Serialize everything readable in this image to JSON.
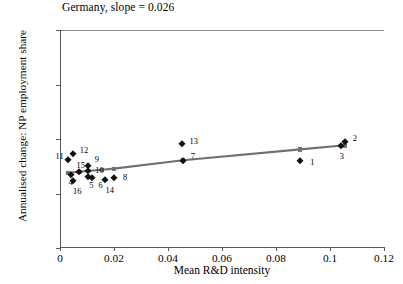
{
  "chart_data": {
    "type": "scatter",
    "title": "Germany, slope = 0.026",
    "xlabel": "Mean R&D intensity",
    "ylabel": "Annualised change: NP employment share",
    "xlim": [
      0,
      0.12
    ],
    "ylim": [
      -0.005,
      0.015
    ],
    "xticks": [
      "0",
      "0.02",
      "0.04",
      "0.06",
      "0.08",
      "0.1",
      "0.12"
    ],
    "xtick_values": [
      0,
      0.02,
      0.04,
      0.06,
      0.08,
      0.1,
      0.12
    ],
    "yticks": [
      "-0.005",
      "0",
      "0.005",
      "0.01",
      "0.015"
    ],
    "ytick_values": [
      -0.005,
      0,
      0.005,
      0.01,
      0.015
    ],
    "grid": false,
    "legend": "none",
    "slope": 0.026,
    "reference_line_y": 0,
    "marker_color": "#111111",
    "fit_color": "#6e7073",
    "points": [
      {
        "label": "1",
        "x": 0.089,
        "y": 0.00295,
        "lx": 10,
        "ly": 2
      },
      {
        "label": "2",
        "x": 0.1055,
        "y": 0.00475,
        "lx": 8,
        "ly": -3
      },
      {
        "label": "3",
        "x": 0.104,
        "y": 0.0044,
        "lx": -1,
        "ly": 11
      },
      {
        "label": "4",
        "x": 0.004,
        "y": 0.0017,
        "lx": -2,
        "ly": 8
      },
      {
        "label": "5",
        "x": 0.0105,
        "y": 0.00155,
        "lx": 1,
        "ly": 9
      },
      {
        "label": "6",
        "x": 0.012,
        "y": 0.00145,
        "lx": 6,
        "ly": 8
      },
      {
        "label": "7",
        "x": 0.0455,
        "y": 0.003,
        "lx": 8,
        "ly": -4
      },
      {
        "label": "8",
        "x": 0.02,
        "y": 0.0014,
        "lx": 9,
        "ly": 0
      },
      {
        "label": "9",
        "x": 0.0103,
        "y": 0.0025,
        "lx": 7,
        "ly": -6
      },
      {
        "label": "10",
        "x": 0.0105,
        "y": 0.00205,
        "lx": 7,
        "ly": 0
      },
      {
        "label": "11",
        "x": 0.0028,
        "y": 0.0031,
        "lx": -12,
        "ly": -3
      },
      {
        "label": "12",
        "x": 0.0047,
        "y": 0.00365,
        "lx": 7,
        "ly": -3
      },
      {
        "label": "13",
        "x": 0.045,
        "y": 0.00455,
        "lx": 8,
        "ly": -2
      },
      {
        "label": "14",
        "x": 0.0165,
        "y": 0.00125,
        "lx": 1,
        "ly": 11
      },
      {
        "label": "15",
        "x": 0.0072,
        "y": 0.002,
        "lx": -3,
        "ly": -6
      },
      {
        "label": "16",
        "x": 0.0048,
        "y": 0.00115,
        "lx": 0,
        "ly": 11
      }
    ],
    "fit_line": {
      "x": [
        0.003,
        0.0072,
        0.0155,
        0.02,
        0.0455,
        0.089,
        0.1055
      ],
      "y": [
        0.0019,
        0.002,
        0.00218,
        0.00228,
        0.00305,
        0.00405,
        0.00442
      ]
    }
  }
}
